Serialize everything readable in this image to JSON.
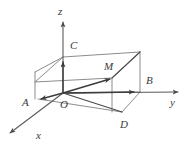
{
  "figure": {
    "kind": "3d-rectangular-box-with-axes",
    "background_color": "#ffffff",
    "edge_color": "#8c8c8c",
    "axis_color": "#5a5a5a",
    "vector_color": "#3c3c3c",
    "label_color": "#3a3a3a",
    "axes": [
      {
        "name": "x",
        "label": "x",
        "label_x": 36,
        "label_y": 139,
        "direction": "down-left"
      },
      {
        "name": "y",
        "label": "y",
        "label_x": 170,
        "label_y": 106,
        "direction": "right"
      },
      {
        "name": "z",
        "label": "z",
        "label_x": 58,
        "label_y": 15,
        "direction": "up"
      }
    ],
    "points": [
      {
        "name": "O",
        "label": "O",
        "label_x": 60,
        "label_y": 108,
        "role": "origin"
      },
      {
        "name": "A",
        "label": "A",
        "label_x": 22,
        "label_y": 106,
        "role": "vertex"
      },
      {
        "name": "B",
        "label": "B",
        "label_x": 146,
        "label_y": 84,
        "role": "vertex"
      },
      {
        "name": "C",
        "label": "C",
        "label_x": 70,
        "label_y": 49,
        "role": "vertex"
      },
      {
        "name": "D",
        "label": "D",
        "label_x": 120,
        "label_y": 128,
        "role": "vertex"
      },
      {
        "name": "M",
        "label": "M",
        "label_x": 104,
        "label_y": 70,
        "role": "midpoint-marker"
      }
    ],
    "vectors": [
      {
        "name": "OM",
        "from": "O",
        "to": "M"
      },
      {
        "name": "OA",
        "from": "O",
        "to": "A"
      },
      {
        "name": "OB",
        "from": "O",
        "to": "B"
      },
      {
        "name": "OC",
        "from": "O",
        "to": "C"
      }
    ],
    "segments": [
      {
        "name": "OD",
        "from": "O",
        "to": "D"
      },
      {
        "name": "DB",
        "from": "D",
        "to": "B"
      },
      {
        "name": "MB-top",
        "from": "M",
        "to": "top-right-corner"
      }
    ]
  }
}
